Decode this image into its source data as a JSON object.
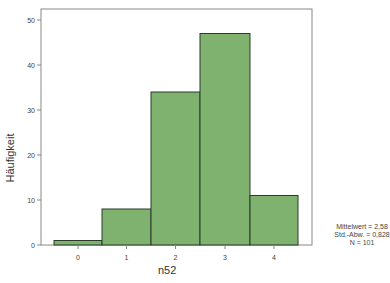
{
  "chart_data": {
    "type": "bar",
    "subtype": "histogram",
    "title": "",
    "xlabel": "n52",
    "ylabel": "Häufigkeit",
    "categories": [
      "0",
      "1",
      "2",
      "3",
      "4"
    ],
    "values": [
      1,
      8,
      34,
      47,
      11
    ],
    "ylim": [
      0,
      52
    ],
    "yticks": [
      0,
      10,
      20,
      30,
      40,
      50
    ],
    "grid": false,
    "bar_color": "#7fb26f",
    "bar_edge_color": "#2b3a2b",
    "legend": null,
    "annotations": {
      "mean": "Mittelwert = 2,58",
      "sd": "Std.-Abw. = 0,828",
      "n": "N = 101"
    }
  }
}
